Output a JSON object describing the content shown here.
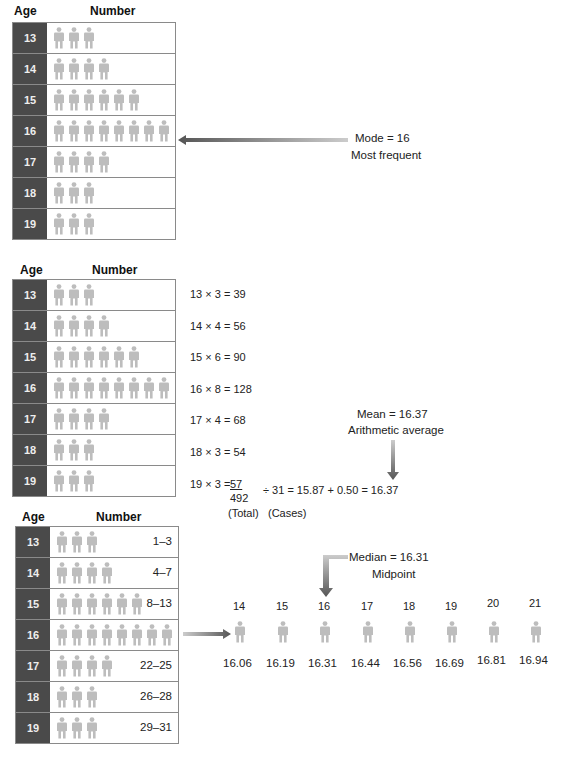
{
  "colors": {
    "age_cell": "#4a4a4a",
    "figure": "#bdbdbd",
    "border": "#8a8a8a",
    "arrow": "#6a6a6a"
  },
  "headers": {
    "age": "Age",
    "number": "Number"
  },
  "panel_mode": {
    "rows": [
      {
        "age": "13",
        "count": 3
      },
      {
        "age": "14",
        "count": 4
      },
      {
        "age": "15",
        "count": 6
      },
      {
        "age": "16",
        "count": 8
      },
      {
        "age": "17",
        "count": 4
      },
      {
        "age": "18",
        "count": 3
      },
      {
        "age": "19",
        "count": 3
      }
    ],
    "label": "Mode  =  16",
    "sublabel": "Most frequent"
  },
  "panel_mean": {
    "equations": [
      "13 × 3 = 39",
      "14 × 4 = 56",
      "15 × 6 = 90",
      "16 × 8 = 128",
      "17 × 4 = 68",
      "18 × 3 = 54"
    ],
    "last_prefix": "19 × 3 = ",
    "last_value": "57",
    "total": "492",
    "calc": "÷   31  =   15.87 + 0.50 = 16.37",
    "total_label": "(Total)",
    "cases_label": "(Cases)",
    "label": "Mean  =  16.37",
    "sublabel": "Arithmetic average"
  },
  "panel_median": {
    "ranges": [
      "1–3",
      "4–7",
      "8–13",
      "",
      "22–25",
      "26–28",
      "29–31"
    ],
    "label": "Median  =  16.31",
    "sublabel": "Midpoint",
    "positions": [
      {
        "n": "14",
        "v": "16.06"
      },
      {
        "n": "15",
        "v": "16.19"
      },
      {
        "n": "16",
        "v": "16.31"
      },
      {
        "n": "17",
        "v": "16.44"
      },
      {
        "n": "18",
        "v": "16.56"
      },
      {
        "n": "19",
        "v": "16.69"
      },
      {
        "n": "20",
        "v": "16.81"
      },
      {
        "n": "21",
        "v": "16.94"
      }
    ]
  }
}
